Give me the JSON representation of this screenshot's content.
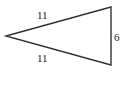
{
  "diagram": {
    "type": "isosceles-triangle",
    "sides": {
      "top": "11",
      "bottom": "11",
      "right": "6"
    },
    "vertices": {
      "left": [
        6,
        36
      ],
      "top_right": [
        111,
        7
      ],
      "bottom_right": [
        111,
        65
      ]
    },
    "stroke_color": "#333333"
  }
}
